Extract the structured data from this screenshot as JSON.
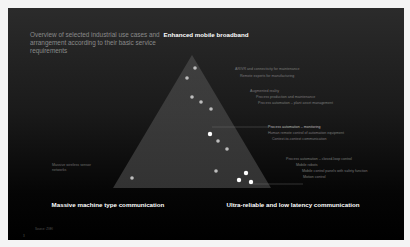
{
  "intro_text": "Overview of selected industrial use cases and arrangement according to their basic service requirements",
  "corners": {
    "top": "Enhanced mobile broadband",
    "bottom_left": "Massive machine type communication",
    "bottom_right": "Ultra-reliable and low latency communication"
  },
  "left_label": "Massive wireless sensor networks",
  "right_labels": [
    {
      "text": "AR/VR and connectivity for maintenance",
      "x": 235,
      "y": 67
    },
    {
      "text": "Remote experts for manufacturing",
      "x": 240,
      "y": 74
    },
    {
      "text": "Augmented reality",
      "x": 250,
      "y": 89
    },
    {
      "text": "Process production and maintenance",
      "x": 256,
      "y": 95
    },
    {
      "text": "Process automation – plant asset management",
      "x": 258,
      "y": 101
    },
    {
      "text": "Process automation – monitoring",
      "x": 268,
      "y": 125,
      "highlight": true
    },
    {
      "text": "Human remote control of automation equipment",
      "x": 268,
      "y": 131
    },
    {
      "text": "Context-to-context communication",
      "x": 272,
      "y": 137
    },
    {
      "text": "Process automation – closed-loop control",
      "x": 286,
      "y": 157
    },
    {
      "text": "Mobile robots",
      "x": 296,
      "y": 163
    },
    {
      "text": "Mobile control panels with safety function",
      "x": 302,
      "y": 169
    },
    {
      "text": "Motion control",
      "x": 303,
      "y": 175
    }
  ],
  "dots": [
    {
      "x": 195,
      "y": 68
    },
    {
      "x": 187,
      "y": 78
    },
    {
      "x": 192,
      "y": 97
    },
    {
      "x": 201,
      "y": 102
    },
    {
      "x": 211,
      "y": 109
    },
    {
      "x": 210,
      "y": 134,
      "bright": true
    },
    {
      "x": 218,
      "y": 141
    },
    {
      "x": 227,
      "y": 149
    },
    {
      "x": 216,
      "y": 171
    },
    {
      "x": 246,
      "y": 173,
      "bright": true
    },
    {
      "x": 239,
      "y": 180,
      "bright": true
    },
    {
      "x": 251,
      "y": 182,
      "bright": true
    },
    {
      "x": 132,
      "y": 178
    }
  ],
  "triangle": {
    "apex": [
      192,
      55
    ],
    "left": [
      113,
      188
    ],
    "right": [
      271,
      188
    ]
  },
  "footer": "Source: ZVEI",
  "page_number": "3"
}
